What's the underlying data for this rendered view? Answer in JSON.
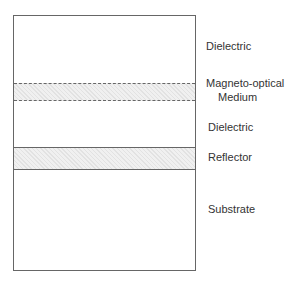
{
  "diagram": {
    "type": "layer-stack",
    "layers": [
      {
        "name": "Dielectric",
        "hatched": false
      },
      {
        "name": "Magneto-optical Medium",
        "line1": "Magneto-optical",
        "line2": "Medium",
        "hatched": true
      },
      {
        "name": "Dielectric",
        "hatched": false
      },
      {
        "name": "Reflector",
        "hatched": true
      },
      {
        "name": "Substrate",
        "hatched": false
      }
    ]
  },
  "colors": {
    "outline": "#666666",
    "hatch_fill": "#f0f0f0",
    "text": "#333333"
  }
}
